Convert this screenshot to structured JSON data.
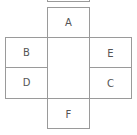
{
  "diagram": {
    "type": "cube-net",
    "faces": {
      "top_partial": "",
      "A": "A",
      "B": "B",
      "D": "D",
      "E": "E",
      "C": "C",
      "F": "F"
    },
    "line_color": "#9a9a9a",
    "text_color": "#555555"
  }
}
